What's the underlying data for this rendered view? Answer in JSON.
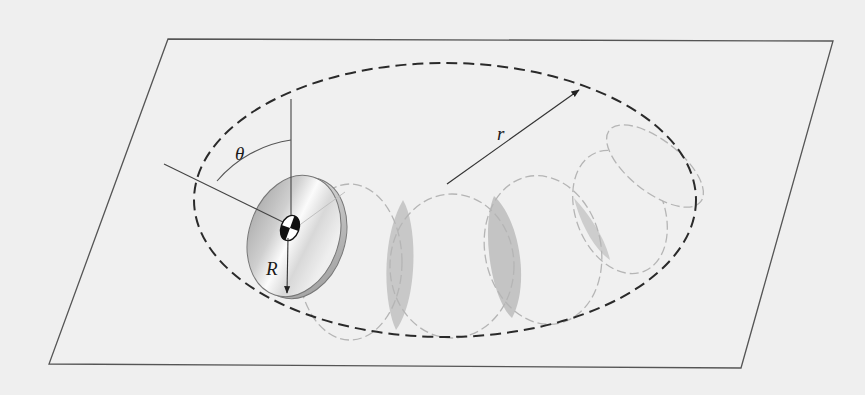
{
  "figure": {
    "type": "mechanics-diagram",
    "labels": {
      "theta": "θ",
      "disk_radius": "R",
      "path_radius": "r"
    },
    "colors": {
      "background": "#efefef",
      "plane_edge": "#555555",
      "path_dash": "#2a2a2a",
      "ghost_outline": "#b8b8b8",
      "ghost_overlap": "#c9c9c9",
      "disk_light": "#f7f7f7",
      "disk_dark": "#a8a8a8"
    },
    "plane": {
      "corners": [
        [
          168,
          39
        ],
        [
          833,
          41
        ],
        [
          741,
          368
        ],
        [
          49,
          364
        ]
      ]
    },
    "path": {
      "center": [
        445,
        200
      ],
      "rx": 252,
      "ry": 137
    },
    "ghost_disks": [
      {
        "cx": 350,
        "cy": 262,
        "rx": 52,
        "ry": 78,
        "rot": 0
      },
      {
        "cx": 455,
        "cy": 268,
        "rx": 62,
        "ry": 72,
        "rot": 0
      },
      {
        "cx": 540,
        "cy": 248,
        "rx": 57,
        "ry": 75,
        "rot": -10
      },
      {
        "cx": 612,
        "cy": 218,
        "rx": 48,
        "ry": 63,
        "rot": -22
      },
      {
        "cx": 652,
        "cy": 172,
        "rx": 35,
        "ry": 57,
        "rot": -45
      }
    ]
  }
}
